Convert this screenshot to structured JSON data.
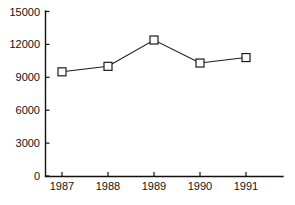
{
  "chart_data": {
    "type": "line",
    "title": "",
    "subtitle": "",
    "xlabel": "",
    "ylabel": "",
    "categories": [
      "1987",
      "1988",
      "1989",
      "1990",
      "1991"
    ],
    "values": [
      9500,
      10000,
      12400,
      10300,
      10800
    ],
    "series": [
      {
        "name": "series-1",
        "values": [
          9500,
          10000,
          12400,
          10300,
          10800
        ],
        "marker": "open-square",
        "line_color": "#1a1a1a",
        "marker_fill": "#ffffff",
        "marker_edge": "#1a1a1a"
      }
    ],
    "ylim": [
      0,
      15000
    ],
    "yticks": [
      0,
      3000,
      6000,
      9000,
      12000,
      15000
    ],
    "ytick_labels": [
      "0",
      "3000",
      "6000",
      "9000",
      "12000",
      "15000"
    ],
    "xtick_labels": [
      "1987",
      "1988",
      "1989",
      "1990",
      "1991"
    ],
    "grid": false,
    "legend": false,
    "legend_position": "none",
    "annotations": [],
    "background_color": "#ffffff",
    "axis_color": "#111111"
  },
  "axes": {
    "y_axis_name": "y-axis",
    "x_axis_name": "x-axis"
  }
}
